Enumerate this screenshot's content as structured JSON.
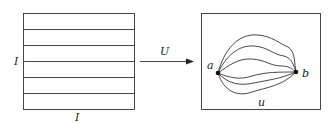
{
  "left_figure": {
    "description": "unit square I x I with horizontal paths",
    "side_label_left": "I",
    "side_label_bottom": "I",
    "horizontal_lines": 5
  },
  "map": {
    "label": "U"
  },
  "right_figure": {
    "point_a": "a",
    "point_b": "b",
    "region_label": "u",
    "paths": 6
  },
  "colors": {
    "stroke": "#333333",
    "background": "#ffffff"
  }
}
